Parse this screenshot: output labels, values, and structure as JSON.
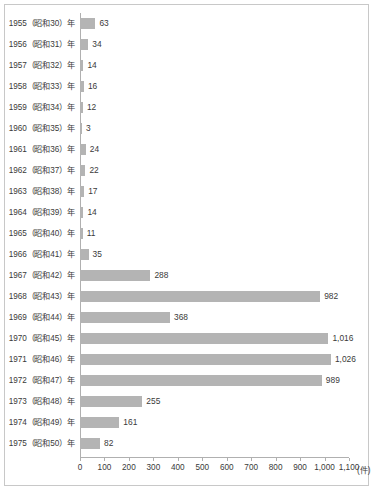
{
  "chart_data": {
    "type": "bar",
    "orientation": "horizontal",
    "title": "",
    "subtitle": "",
    "xlabel": "(件)",
    "ylabel": "",
    "xlim": [
      0,
      1100
    ],
    "grid": false,
    "legend": null,
    "bar_color": "#b4b4b4",
    "axis_color": "#b0b0b0",
    "text_color": "#3a3a3a",
    "xticks": [
      "0",
      "100",
      "200",
      "300",
      "400",
      "500",
      "600",
      "700",
      "800",
      "900",
      "1,000",
      "1,100"
    ],
    "xtick_values": [
      0,
      100,
      200,
      300,
      400,
      500,
      600,
      700,
      800,
      900,
      1000,
      1100
    ],
    "unit_suffix": "(件)",
    "categories": [
      "1955（昭和30）年",
      "1956（昭和31）年",
      "1957（昭和32）年",
      "1958（昭和33）年",
      "1959（昭和34）年",
      "1960（昭和35）年",
      "1961（昭和36）年",
      "1962（昭和37）年",
      "1963（昭和38）年",
      "1964（昭和39）年",
      "1965（昭和40）年",
      "1966（昭和41）年",
      "1967（昭和42）年",
      "1968（昭和43）年",
      "1969（昭和44）年",
      "1970（昭和45）年",
      "1971（昭和46）年",
      "1972（昭和47）年",
      "1973（昭和48）年",
      "1974（昭和49）年",
      "1975（昭和50）年"
    ],
    "values": [
      63,
      34,
      14,
      16,
      12,
      3,
      24,
      22,
      17,
      14,
      11,
      35,
      288,
      982,
      368,
      1016,
      1026,
      989,
      255,
      161,
      82
    ],
    "value_labels": [
      "63",
      "34",
      "14",
      "16",
      "12",
      "3",
      "24",
      "22",
      "17",
      "14",
      "11",
      "35",
      "288",
      "982",
      "368",
      "1,016",
      "1,026",
      "989",
      "255",
      "161",
      "82"
    ]
  }
}
